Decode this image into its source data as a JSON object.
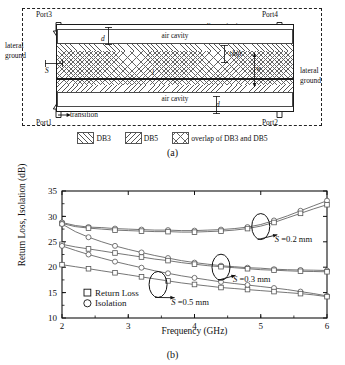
{
  "figure": {
    "panel_a_caption": "(a)",
    "panel_b_caption": "(b)"
  },
  "schematic": {
    "ports": {
      "port3": "Port3",
      "port4": "Port4",
      "port1": "Port1",
      "port2": "Port2"
    },
    "annotations": {
      "lateral_ground_left_line1": "lateral",
      "lateral_ground_left_line2": "ground",
      "lateral_ground_right_line1": "lateral",
      "lateral_ground_right_line2": "ground",
      "discontinuity": "discontinuity",
      "transition": "transition",
      "air_cavity_top": "air cavity",
      "air_cavity_bottom": "air cavity",
      "dim_d_top": "d",
      "dim_d_bottom": "d",
      "dim_s": "S",
      "dim_l": "l",
      "dim_w": "w",
      "dim_shift": "shift"
    },
    "legend": [
      {
        "label": "DB3",
        "pattern": "forward-diagonal-hatch"
      },
      {
        "label": "DB5",
        "pattern": "back-diagonal-hatch"
      },
      {
        "label": "overlap of DB3 and DB5",
        "pattern": "cross-hatch"
      }
    ]
  },
  "chart_data": {
    "type": "line",
    "title": "",
    "xlabel": "Frequency (GHz)",
    "ylabel": "Return Loss, Isolation (dB)",
    "xlim": [
      2,
      6
    ],
    "ylim": [
      10,
      35
    ],
    "xticks": [
      2,
      3,
      4,
      5,
      6
    ],
    "yticks": [
      10,
      15,
      20,
      25,
      30,
      35
    ],
    "grid": false,
    "legend_position": "inner-lower-left",
    "legend": [
      {
        "label": "Return Loss",
        "marker": "square"
      },
      {
        "label": "Isolation",
        "marker": "circle"
      }
    ],
    "annotations": [
      {
        "text": "S =0.2 mm",
        "callout_x": 5.0,
        "callout_y": 28.0
      },
      {
        "text": "S =0.3 mm",
        "callout_x": 4.4,
        "callout_y": 20.0
      },
      {
        "text": "S =0.5 mm",
        "callout_x": 3.45,
        "callout_y": 16.6
      }
    ],
    "x": [
      2.0,
      2.2,
      2.4,
      2.6,
      2.8,
      3.0,
      3.2,
      3.4,
      3.6,
      3.8,
      4.0,
      4.2,
      4.4,
      4.6,
      4.8,
      5.0,
      5.2,
      5.4,
      5.6,
      5.8,
      6.0
    ],
    "series": [
      {
        "name": "Isolation, S = 0.2 mm",
        "marker": "circle",
        "group": "S =0.2 mm",
        "values": [
          28.8,
          28.2,
          27.9,
          27.8,
          27.6,
          27.5,
          27.4,
          27.3,
          27.3,
          27.2,
          27.2,
          27.3,
          27.4,
          27.6,
          27.9,
          28.4,
          29.2,
          30.1,
          31.1,
          32.1,
          33.1
        ]
      },
      {
        "name": "Return Loss, S = 0.2 mm",
        "marker": "square",
        "group": "S =0.2 mm",
        "values": [
          28.6,
          28.0,
          27.7,
          27.5,
          27.3,
          27.2,
          27.1,
          27.0,
          27.0,
          26.9,
          26.9,
          27.0,
          27.1,
          27.3,
          27.6,
          28.1,
          28.8,
          29.7,
          30.6,
          31.5,
          32.3
        ]
      },
      {
        "name": "Isolation, S = 0.3 mm",
        "marker": "circle",
        "group": "S =0.3 mm",
        "values": [
          28.5,
          27.0,
          25.9,
          25.0,
          24.2,
          23.5,
          22.9,
          22.3,
          21.8,
          21.3,
          20.9,
          20.6,
          20.3,
          20.1,
          19.9,
          19.8,
          19.6,
          19.5,
          19.45,
          19.4,
          19.35
        ]
      },
      {
        "name": "Return Loss, S = 0.3 mm",
        "marker": "square",
        "group": "S =0.3 mm",
        "values": [
          24.5,
          24.0,
          23.6,
          23.2,
          22.8,
          22.4,
          22.0,
          21.6,
          21.3,
          20.9,
          20.6,
          20.3,
          20.1,
          19.9,
          19.7,
          19.5,
          19.4,
          19.3,
          19.2,
          19.15,
          19.1
        ]
      },
      {
        "name": "Isolation, S = 0.5 mm",
        "marker": "circle",
        "group": "S =0.5 mm",
        "values": [
          24.2,
          23.3,
          22.5,
          21.8,
          21.1,
          20.5,
          19.9,
          19.3,
          18.8,
          18.3,
          17.9,
          17.5,
          17.1,
          16.8,
          16.5,
          16.2,
          15.9,
          15.6,
          15.2,
          14.8,
          14.35
        ]
      },
      {
        "name": "Return Loss, S = 0.5 mm",
        "marker": "square",
        "group": "S =0.5 mm",
        "values": [
          20.5,
          20.1,
          19.7,
          19.3,
          18.9,
          18.5,
          18.1,
          17.7,
          17.3,
          16.9,
          16.6,
          16.3,
          16.0,
          15.8,
          15.6,
          15.4,
          15.2,
          15.0,
          14.8,
          14.55,
          14.2
        ]
      }
    ]
  }
}
